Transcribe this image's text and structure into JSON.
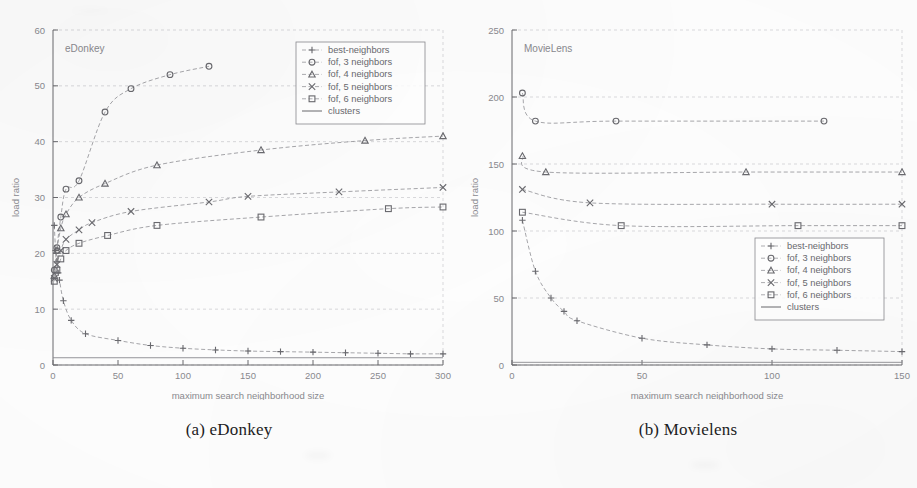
{
  "figure": {
    "panels": [
      {
        "id": "a",
        "caption": "(a) eDonkey",
        "inner_label": "eDonkey"
      },
      {
        "id": "b",
        "caption": "(b) Movielens",
        "inner_label": "MovieLens"
      }
    ]
  },
  "legend": {
    "entries": [
      {
        "label": "best-neighbors",
        "marker": "plus",
        "color": "#9a9a9e"
      },
      {
        "label": "fof, 3 neighbors",
        "marker": "circle",
        "color": "#8d8d92"
      },
      {
        "label": "fof, 4 neighbors",
        "marker": "triangle",
        "color": "#8d8d92"
      },
      {
        "label": "fof, 5 neighbors",
        "marker": "cross",
        "color": "#8d8d92"
      },
      {
        "label": "fof, 6 neighbors",
        "marker": "square",
        "color": "#8d8d92"
      },
      {
        "label": "clusters",
        "marker": "line",
        "color": "#8d8d92"
      }
    ]
  },
  "chart_data": [
    {
      "type": "line",
      "panel": "a",
      "title": "eDonkey",
      "xlabel": "maximum search neighborhood size",
      "ylabel": "load ratio",
      "xlim": [
        0,
        300
      ],
      "ylim": [
        0,
        60
      ],
      "xticks": [
        0,
        50,
        100,
        150,
        200,
        250,
        300
      ],
      "yticks": [
        0,
        10,
        20,
        30,
        40,
        50,
        60
      ],
      "grid": true,
      "legend_position": "top-right",
      "series": [
        {
          "name": "best-neighbors",
          "marker": "plus",
          "points": [
            [
              1,
              25.0
            ],
            [
              2,
              20.5
            ],
            [
              3,
              18.5
            ],
            [
              4,
              16.5
            ],
            [
              5,
              15.2
            ],
            [
              8,
              11.5
            ],
            [
              14,
              8.0
            ],
            [
              25,
              5.6
            ],
            [
              50,
              4.4
            ],
            [
              75,
              3.5
            ],
            [
              100,
              3.0
            ],
            [
              125,
              2.7
            ],
            [
              150,
              2.5
            ],
            [
              175,
              2.4
            ],
            [
              200,
              2.3
            ],
            [
              225,
              2.2
            ],
            [
              250,
              2.1
            ],
            [
              275,
              2.0
            ],
            [
              300,
              2.0
            ]
          ]
        },
        {
          "name": "fof, 3 neighbors",
          "marker": "circle",
          "points": [
            [
              1,
              17.0
            ],
            [
              3,
              21.0
            ],
            [
              6,
              26.5
            ],
            [
              10,
              31.5
            ],
            [
              20,
              33.0
            ],
            [
              40,
              45.3
            ],
            [
              60,
              49.5
            ],
            [
              90,
              52.0
            ],
            [
              120,
              53.5
            ]
          ]
        },
        {
          "name": "fof, 4 neighbors",
          "marker": "triangle",
          "points": [
            [
              1,
              16.0
            ],
            [
              3,
              20.5
            ],
            [
              6,
              24.5
            ],
            [
              10,
              27.0
            ],
            [
              20,
              30.0
            ],
            [
              40,
              32.5
            ],
            [
              80,
              35.8
            ],
            [
              160,
              38.5
            ],
            [
              240,
              40.2
            ],
            [
              300,
              41.0
            ]
          ]
        },
        {
          "name": "fof, 5 neighbors",
          "marker": "cross",
          "points": [
            [
              1,
              15.5
            ],
            [
              3,
              18.0
            ],
            [
              6,
              20.5
            ],
            [
              10,
              22.5
            ],
            [
              20,
              24.2
            ],
            [
              30,
              25.5
            ],
            [
              60,
              27.5
            ],
            [
              120,
              29.2
            ],
            [
              150,
              30.2
            ],
            [
              220,
              31.0
            ],
            [
              300,
              31.8
            ]
          ]
        },
        {
          "name": "fof, 6 neighbors",
          "marker": "square",
          "points": [
            [
              1,
              15.0
            ],
            [
              3,
              17.0
            ],
            [
              6,
              19.0
            ],
            [
              10,
              20.5
            ],
            [
              20,
              21.8
            ],
            [
              42,
              23.2
            ],
            [
              80,
              25.0
            ],
            [
              160,
              26.5
            ],
            [
              258,
              28.0
            ],
            [
              300,
              28.3
            ]
          ]
        },
        {
          "name": "clusters",
          "marker": "line",
          "points": [
            [
              0,
              1.3
            ],
            [
              300,
              1.3
            ]
          ]
        }
      ]
    },
    {
      "type": "line",
      "panel": "b",
      "title": "MovieLens",
      "xlabel": "maximum search neighborhood size",
      "ylabel": "load ratio",
      "xlim": [
        0,
        150
      ],
      "ylim": [
        0,
        250
      ],
      "xticks": [
        0,
        50,
        100,
        150
      ],
      "yticks": [
        0,
        50,
        100,
        150,
        200,
        250
      ],
      "grid": true,
      "legend_position": "right-middle",
      "series": [
        {
          "name": "best-neighbors",
          "marker": "plus",
          "points": [
            [
              4,
              108
            ],
            [
              9,
              70
            ],
            [
              15,
              50
            ],
            [
              20,
              40
            ],
            [
              25,
              33
            ],
            [
              50,
              20
            ],
            [
              75,
              15
            ],
            [
              100,
              12
            ],
            [
              125,
              11
            ],
            [
              150,
              10
            ]
          ]
        },
        {
          "name": "fof, 3 neighbors",
          "marker": "circle",
          "points": [
            [
              4,
              203
            ],
            [
              9,
              182
            ],
            [
              40,
              182
            ],
            [
              120,
              182
            ]
          ]
        },
        {
          "name": "fof, 4 neighbors",
          "marker": "triangle",
          "points": [
            [
              4,
              156
            ],
            [
              13,
              144
            ],
            [
              90,
              144
            ],
            [
              150,
              144
            ]
          ]
        },
        {
          "name": "fof, 5 neighbors",
          "marker": "cross",
          "points": [
            [
              4,
              131
            ],
            [
              30,
              121
            ],
            [
              100,
              120
            ],
            [
              150,
              120
            ]
          ]
        },
        {
          "name": "fof, 6 neighbors",
          "marker": "square",
          "points": [
            [
              4,
              114
            ],
            [
              42,
              104
            ],
            [
              110,
              104
            ],
            [
              150,
              104
            ]
          ]
        },
        {
          "name": "clusters",
          "marker": "line",
          "points": [
            [
              0,
              2
            ],
            [
              150,
              2
            ]
          ]
        }
      ]
    }
  ],
  "colors": {
    "ink": "#8a8a8f",
    "ink_dark": "#6a6a6f",
    "grid": "#c9c9cd",
    "caption": "#1d1d1f",
    "paper": "#fdfdfd"
  }
}
